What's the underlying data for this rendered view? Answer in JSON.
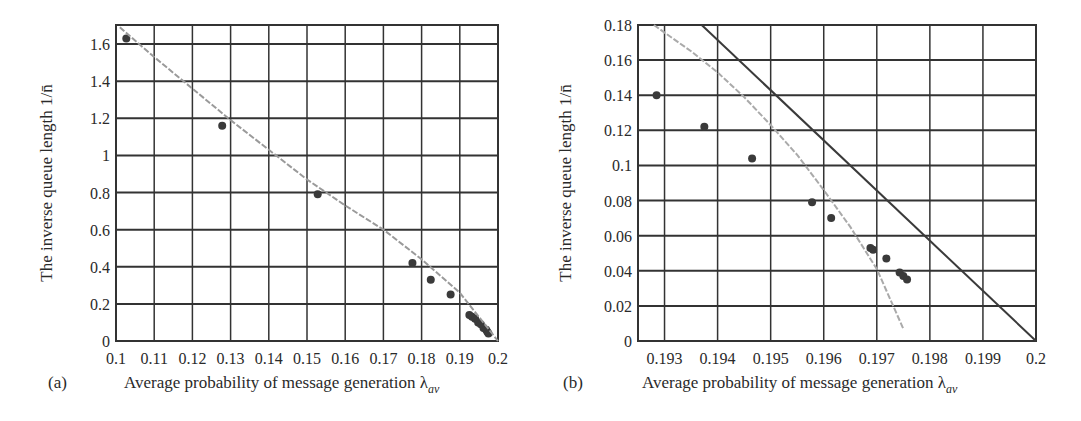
{
  "chart_data": [
    {
      "panel": "(a)",
      "type": "scatter",
      "xlabel": "Average probability of message generation λ_av",
      "xlabel_main": "Average probability of message generation λ",
      "xlabel_sub": "av",
      "ylabel": "The inverse queue length 1/n̄",
      "xlim": [
        0.1,
        0.2
      ],
      "ylim": [
        0,
        1.7
      ],
      "grid": true,
      "x_ticks": [
        "0.1",
        "0.11",
        "0.12",
        "0.13",
        "0.14",
        "0.15",
        "0.16",
        "0.17",
        "0.18",
        "0.19",
        "0.2"
      ],
      "y_ticks": [
        "0",
        "0.2",
        "0.4",
        "0.6",
        "0.8",
        "1",
        "1.2",
        "1.4",
        "1.6"
      ],
      "series": [
        {
          "name": "Simulation points",
          "style": "dots",
          "color": "#3a3a3a",
          "x": [
            0.1027,
            0.1278,
            0.1528,
            0.1776,
            0.1824,
            0.1876,
            0.1925,
            0.1932,
            0.194,
            0.1948,
            0.1955,
            0.1962,
            0.1969,
            0.1972,
            0.1975
          ],
          "y": [
            1.63,
            1.16,
            0.79,
            0.42,
            0.33,
            0.25,
            0.14,
            0.13,
            0.12,
            0.1,
            0.09,
            0.07,
            0.06,
            0.05,
            0.04
          ]
        },
        {
          "name": "Analytical curve",
          "style": "dashed-gray",
          "color": "#9a9a9a",
          "x": [
            0.101,
            0.11,
            0.12,
            0.13,
            0.14,
            0.15,
            0.16,
            0.17,
            0.18,
            0.185,
            0.19,
            0.195,
            0.2
          ],
          "y": [
            1.69,
            1.53,
            1.36,
            1.19,
            1.03,
            0.87,
            0.73,
            0.6,
            0.44,
            0.35,
            0.26,
            0.13,
            0.0
          ]
        }
      ]
    },
    {
      "panel": "(b)",
      "type": "scatter",
      "xlabel": "Average probability of message generation λ_av",
      "xlabel_main": "Average probability of message generation λ",
      "xlabel_sub": "av",
      "ylabel": "The inverse queue length 1/n̄",
      "xlim": [
        0.1925,
        0.2
      ],
      "ylim": [
        0,
        0.18
      ],
      "grid": true,
      "x_ticks": [
        "0.193",
        "0.194",
        "0.195",
        "0.196",
        "0.197",
        "0.198",
        "0.199",
        "0.2"
      ],
      "y_ticks": [
        "0",
        "0.02",
        "0.04",
        "0.06",
        "0.08",
        "0.1",
        "0.12",
        "0.14",
        "0.16",
        "0.18"
      ],
      "series": [
        {
          "name": "Simulation points",
          "style": "dots",
          "color": "#3a3a3a",
          "x": [
            0.19285,
            0.19375,
            0.19465,
            0.19578,
            0.19614,
            0.19688,
            0.19693,
            0.19718,
            0.19743,
            0.1975,
            0.19757
          ],
          "y": [
            0.14,
            0.122,
            0.104,
            0.079,
            0.07,
            0.053,
            0.052,
            0.047,
            0.039,
            0.037,
            0.035
          ]
        },
        {
          "name": "Analytical curve (dashed)",
          "style": "dashed-gray",
          "color": "#aaaaaa",
          "x": [
            0.1928,
            0.1935,
            0.194,
            0.1945,
            0.195,
            0.1955,
            0.196,
            0.1965,
            0.197,
            0.1975
          ],
          "y": [
            0.18,
            0.165,
            0.153,
            0.139,
            0.123,
            0.106,
            0.086,
            0.065,
            0.041,
            0.007
          ]
        },
        {
          "name": "Linear bound",
          "style": "solid-dark",
          "color": "#3a3a3a",
          "x": [
            0.1937,
            0.2
          ],
          "y": [
            0.18,
            0.0
          ]
        }
      ]
    }
  ]
}
